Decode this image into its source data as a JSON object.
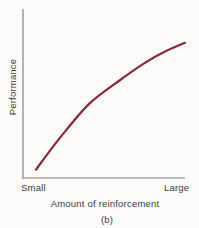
{
  "figure": {
    "y_axis_title": "Performance",
    "x_axis_title": "Amount of reinforcement",
    "x_min_label": "Small",
    "x_max_label": "Large",
    "caption": "(b)"
  },
  "colors": {
    "curve": "#8b2838",
    "axis": "#828282",
    "text": "#3b3b3b",
    "background": "#fcfbf9"
  },
  "chart_data": {
    "type": "line",
    "title": "",
    "xlabel": "Amount of reinforcement",
    "ylabel": "Performance",
    "caption": "(b)",
    "x_axis_endpoints": [
      "Small",
      "Large"
    ],
    "axes": "qualitative, no numeric ticks or gridlines",
    "grid": false,
    "legend": false,
    "shape_description": "negatively accelerated curve: performance rises steeply at small amounts of reinforcement and levels off toward large amounts",
    "series": [
      {
        "name": "performance-curve",
        "color": "#8b2838",
        "points_normalized": [
          [
            0.08,
            0.05
          ],
          [
            0.23,
            0.24
          ],
          [
            0.41,
            0.44
          ],
          [
            0.6,
            0.58
          ],
          [
            0.75,
            0.68
          ],
          [
            0.88,
            0.75
          ],
          [
            1.0,
            0.8
          ]
        ]
      }
    ]
  }
}
